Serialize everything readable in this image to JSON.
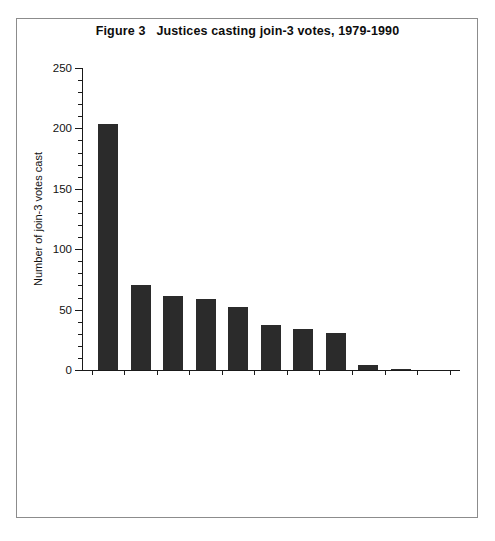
{
  "figure": {
    "title": "Figure 3   Justices casting join-3 votes, 1979-1990"
  },
  "chart_data": {
    "type": "bar",
    "title": "Figure 3   Justices casting join-3 votes, 1979-1990",
    "xlabel": "",
    "ylabel": "Number of join-3 votes cast",
    "ylim": [
      0,
      250
    ],
    "ytick_labels": [
      "0",
      "50",
      "100",
      "150",
      "200",
      "250"
    ],
    "ytick_values": [
      0,
      50,
      100,
      150,
      200,
      250
    ],
    "minor_tick_interval": 10,
    "grid": false,
    "legend": null,
    "bar_color": "#2b2b2b",
    "categories": [
      "Blackmun, 1979-1990",
      "O'Connor, 1981-1990",
      "Marshall, 1979-1990",
      "Burger, 1979-1985",
      "Rehnquist, 1979-1990",
      "White, 1979-1990",
      "Powell, 1979-1986",
      "Brennan, 1979-1990",
      "Kennedy, 1988-1990",
      "Scalia, 1986-1990",
      "Stevens, 1979-1990"
    ],
    "values": [
      204,
      70,
      61,
      59,
      52,
      37,
      34,
      31,
      4,
      1,
      0
    ]
  }
}
